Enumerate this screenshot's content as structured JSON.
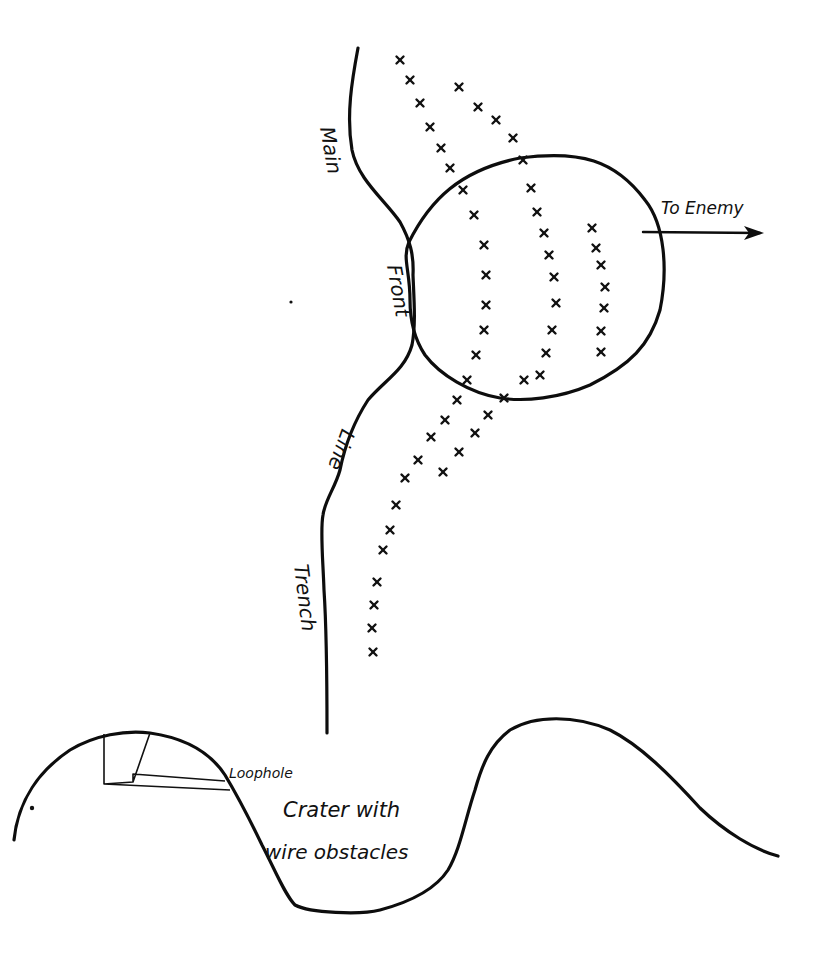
{
  "diagram": {
    "type": "trench-crater-sketch",
    "labels": {
      "trench_words": [
        "Main",
        "Front",
        "Line",
        "Trench"
      ],
      "direction": "To Enemy",
      "loophole": "Loophole",
      "crater_line1": "Crater with",
      "crater_line2": "wire obstacles"
    },
    "colors": {
      "ink": "#0d0d0d",
      "paper": "#ffffff"
    },
    "wire_rows": [
      {
        "name": "outer-left-row",
        "points": [
          [
            400,
            60
          ],
          [
            410,
            80
          ],
          [
            420,
            103
          ],
          [
            430,
            127
          ],
          [
            441,
            148
          ],
          [
            450,
            168
          ],
          [
            463,
            190
          ],
          [
            474,
            215
          ],
          [
            484,
            245
          ],
          [
            486,
            275
          ],
          [
            486,
            305
          ],
          [
            484,
            330
          ],
          [
            476,
            355
          ],
          [
            467,
            380
          ],
          [
            457,
            400
          ],
          [
            445,
            420
          ],
          [
            431,
            437
          ],
          [
            418,
            460
          ],
          [
            405,
            478
          ],
          [
            396,
            505
          ],
          [
            390,
            530
          ],
          [
            383,
            550
          ],
          [
            377,
            582
          ],
          [
            374,
            605
          ],
          [
            372,
            628
          ],
          [
            373,
            652
          ]
        ]
      },
      {
        "name": "inner-left-row",
        "points": [
          [
            459,
            87
          ],
          [
            478,
            107
          ],
          [
            496,
            120
          ],
          [
            513,
            138
          ],
          [
            523,
            160
          ],
          [
            531,
            188
          ],
          [
            537,
            212
          ],
          [
            544,
            233
          ],
          [
            549,
            255
          ],
          [
            554,
            277
          ],
          [
            556,
            303
          ],
          [
            552,
            330
          ],
          [
            546,
            353
          ],
          [
            540,
            375
          ],
          [
            524,
            380
          ],
          [
            504,
            398
          ],
          [
            488,
            415
          ],
          [
            475,
            433
          ],
          [
            459,
            452
          ],
          [
            443,
            472
          ]
        ]
      },
      {
        "name": "right-row",
        "points": [
          [
            592,
            228
          ],
          [
            596,
            248
          ],
          [
            601,
            265
          ],
          [
            605,
            287
          ],
          [
            604,
            308
          ],
          [
            601,
            331
          ],
          [
            601,
            352
          ]
        ]
      }
    ]
  }
}
